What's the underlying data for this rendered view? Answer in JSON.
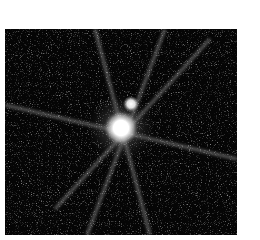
{
  "image": {
    "subject": "bright star with diffraction spikes and a fainter companion",
    "background_color": "#ffffff",
    "frame_color": "#050505",
    "frame": {
      "x": 5,
      "y": 29,
      "width": 232,
      "height": 206
    },
    "primary_star": {
      "cx": 116,
      "cy": 99,
      "r": 12,
      "color": "#ffffff"
    },
    "companion_star": {
      "cx": 126,
      "cy": 75,
      "r": 6,
      "color": "#ffffff"
    },
    "spike_color": "#d8d8d8"
  }
}
